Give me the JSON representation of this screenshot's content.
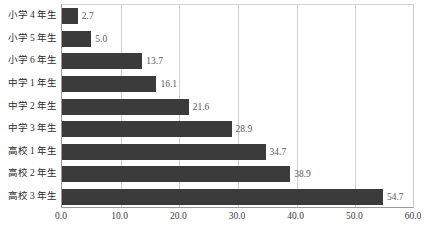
{
  "chart_data": {
    "type": "bar",
    "orientation": "horizontal",
    "title": "",
    "subtitle": "",
    "xlabel": "",
    "ylabel": "",
    "categories": [
      "小学 4 年生",
      "小学 5 年生",
      "小学 6 年生",
      "中学 1 年生",
      "中学 2 年生",
      "中学 3 年生",
      "高校 1 年生",
      "高校 2 年生",
      "高校 3 年生"
    ],
    "values": [
      2.7,
      5.0,
      13.7,
      16.1,
      21.6,
      28.9,
      34.7,
      38.9,
      54.7
    ],
    "value_labels": [
      "2.7",
      "5.0",
      "13.7",
      "16.1",
      "21.6",
      "28.9",
      "34.7",
      "38.9",
      "54.7"
    ],
    "xlim": [
      0.0,
      60.0
    ],
    "xticks": [
      0.0,
      10.0,
      20.0,
      30.0,
      40.0,
      50.0,
      60.0
    ],
    "xtick_labels": [
      "0.0",
      "10.0",
      "20.0",
      "30.0",
      "40.0",
      "50.0",
      "60.0"
    ],
    "grid": true,
    "grid_axis": "x",
    "legend": false,
    "legend_position": "none",
    "bar_color": "#3b3b3b",
    "gridline_color": "#d0d0d0",
    "axis_color": "#9a9a9a",
    "value_label_color": "#595959",
    "category_label_color": "#2b2b2b",
    "background_color": "#ffffff"
  }
}
